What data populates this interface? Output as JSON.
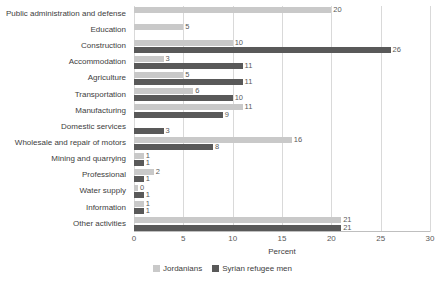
{
  "chart_data": {
    "type": "bar",
    "orientation": "horizontal",
    "title": "",
    "xlabel": "Percent",
    "ylabel": "",
    "xlim": [
      0,
      30
    ],
    "xticks": [
      0,
      5,
      10,
      15,
      20,
      25,
      30
    ],
    "grid": true,
    "legend_position": "bottom",
    "categories": [
      "Public administration and defense",
      "Education",
      "Construction",
      "Accommodation",
      "Agriculture",
      "Transportation",
      "Manufacturing",
      "Domestic services",
      "Wholesale and repair of motors",
      "Mining and quarrying",
      "Professional",
      "Water supply",
      "Information",
      "Other activities"
    ],
    "series": [
      {
        "name": "Jordanians",
        "color": "#c9c9c9",
        "values": [
          20,
          5,
          10,
          3,
          5,
          6,
          11,
          null,
          16,
          1,
          2,
          0,
          1,
          21
        ]
      },
      {
        "name": "Syrian refugee men",
        "color": "#595959",
        "values": [
          null,
          null,
          26,
          11,
          11,
          10,
          9,
          3,
          8,
          1,
          1,
          1,
          1,
          21
        ]
      }
    ]
  },
  "legend": {
    "items": [
      {
        "label": "Jordanians",
        "swatch": "light"
      },
      {
        "label": "Syrian refugee men",
        "swatch": "dark"
      }
    ]
  },
  "axis": {
    "x_label": "Percent"
  }
}
